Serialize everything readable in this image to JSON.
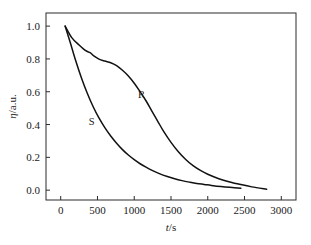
{
  "chart_data": {
    "type": "line",
    "title": "",
    "subtitle": "",
    "xlabel": "t/s",
    "xlabel_italic_part": "t",
    "xlabel_rest": "/s",
    "ylabel": "η/a.u.",
    "ylabel_italic_part": "η",
    "ylabel_rest": "/a.u.",
    "xlim": [
      -200,
      3200
    ],
    "ylim": [
      -0.06,
      1.08
    ],
    "xticks": [
      0,
      500,
      1000,
      1500,
      2000,
      2500,
      3000
    ],
    "xticklabels": [
      "0",
      "500",
      "1000",
      "1500",
      "2000",
      "2500",
      "3000"
    ],
    "yticks": [
      0.0,
      0.2,
      0.4,
      0.6,
      0.8,
      1.0
    ],
    "yticklabels": [
      "0.0",
      "0.2",
      "0.4",
      "0.6",
      "0.8",
      "1.0"
    ],
    "grid": false,
    "legend_position": "inline-annotations",
    "line_color": "#111111",
    "frame_color": "#2b2b2b",
    "background_color": "#ffffff",
    "annotations": [
      {
        "text": "R",
        "x": 1100,
        "y": 0.56
      },
      {
        "text": "S",
        "x": 420,
        "y": 0.4
      }
    ],
    "series": [
      {
        "name": "R",
        "label": "R",
        "x": [
          60,
          150,
          250,
          340,
          400,
          450,
          520,
          600,
          680,
          760,
          840,
          920,
          1000,
          1080,
          1160,
          1240,
          1320,
          1400,
          1500,
          1600,
          1700,
          1800,
          1900,
          2000,
          2150,
          2300,
          2450,
          2600,
          2800
        ],
        "y": [
          1.0,
          0.93,
          0.885,
          0.85,
          0.838,
          0.818,
          0.799,
          0.787,
          0.777,
          0.759,
          0.731,
          0.696,
          0.652,
          0.6,
          0.545,
          0.482,
          0.42,
          0.358,
          0.291,
          0.234,
          0.187,
          0.149,
          0.12,
          0.097,
          0.07,
          0.05,
          0.034,
          0.02,
          0.005
        ]
      },
      {
        "name": "S",
        "label": "S",
        "x": [
          60,
          130,
          200,
          280,
          360,
          440,
          520,
          600,
          680,
          760,
          840,
          920,
          1000,
          1080,
          1160,
          1250,
          1350,
          1450,
          1550,
          1650,
          1750,
          1850,
          1950,
          2050,
          2180,
          2300,
          2450
        ],
        "y": [
          1.0,
          0.9,
          0.795,
          0.687,
          0.592,
          0.51,
          0.44,
          0.381,
          0.33,
          0.286,
          0.247,
          0.214,
          0.186,
          0.161,
          0.14,
          0.119,
          0.099,
          0.083,
          0.069,
          0.058,
          0.049,
          0.041,
          0.035,
          0.029,
          0.022,
          0.017,
          0.012
        ]
      }
    ]
  }
}
